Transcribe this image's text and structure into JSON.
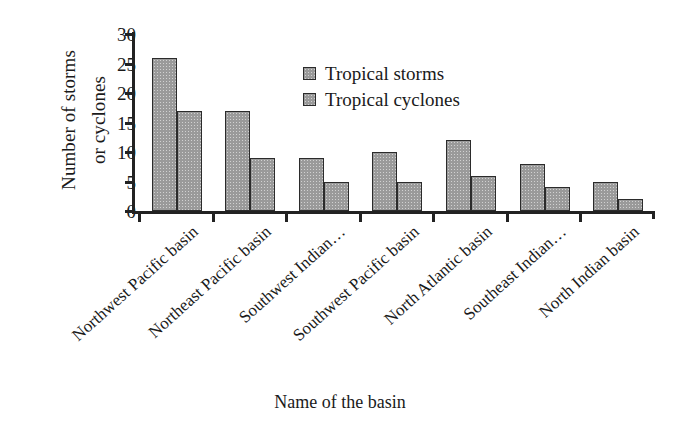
{
  "chart_data": {
    "type": "bar",
    "title": "",
    "xlabel": "Name of the basin",
    "ylabel": "Number of storms or cyclones",
    "ylabel_lines": [
      "Number of storms",
      "or cyclones"
    ],
    "categories": [
      "Northwest Pacific basin",
      "Northeast Pacific basin",
      "Southwest Indian…",
      "Southwest Pacific basin",
      "North Atlantic basin",
      "Southeast Indian…",
      "North Indian basin"
    ],
    "series": [
      {
        "name": "Tropical storms",
        "values": [
          26,
          17,
          9,
          10,
          12,
          8,
          5
        ],
        "color": "#9a9a9a"
      },
      {
        "name": "Tropical cyclones",
        "values": [
          17,
          9,
          5,
          5,
          6,
          4,
          2
        ],
        "color": "#9a9a9a"
      }
    ],
    "ylim": [
      0,
      30
    ],
    "yticks": [
      0,
      5,
      10,
      15,
      20,
      25,
      30
    ],
    "ytick_labels": [
      "0",
      "5",
      "10",
      "15",
      "20",
      "25",
      "30"
    ],
    "grid": false,
    "legend_position": "upper-center",
    "axis_color": "#222222",
    "bar_border_color": "#2b2b2b",
    "background": "#ffffff"
  },
  "legend": {
    "items": [
      {
        "label": "Tropical storms"
      },
      {
        "label": "Tropical cyclones"
      }
    ]
  }
}
